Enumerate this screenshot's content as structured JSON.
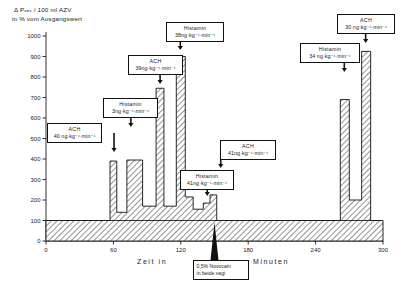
{
  "chart_data": {
    "type": "bar",
    "title": "",
    "ylabel_line1": "Δ Pₒₑₛ / 100 ml AZV",
    "ylabel_line2": "in % vom Ausgangswert",
    "xlabel": "Zeit in",
    "xlabel_tail": "Minuten",
    "xlim": [
      0,
      300
    ],
    "ylim": [
      0,
      1000
    ],
    "ytick_labels": [
      "0",
      "100",
      "200",
      "300",
      "400",
      "500",
      "600",
      "700",
      "800",
      "900",
      "1000"
    ],
    "xtick_labels": [
      "0",
      "60",
      "120",
      "180",
      "240",
      "300"
    ],
    "baseline": 100,
    "grid": false,
    "legend": "none",
    "bar_fill": "hatched-diagonal",
    "segments": [
      {
        "x0": 0,
        "x1": 57,
        "y": 100
      },
      {
        "x0": 57,
        "x1": 63,
        "y": 390
      },
      {
        "x0": 63,
        "x1": 72,
        "y": 140
      },
      {
        "x0": 72,
        "x1": 86,
        "y": 395
      },
      {
        "x0": 86,
        "x1": 98,
        "y": 170
      },
      {
        "x0": 98,
        "x1": 105,
        "y": 745
      },
      {
        "x0": 105,
        "x1": 116,
        "y": 170
      },
      {
        "x0": 116,
        "x1": 124,
        "y": 900
      },
      {
        "x0": 124,
        "x1": 131,
        "y": 215
      },
      {
        "x0": 131,
        "x1": 140,
        "y": 155
      },
      {
        "x0": 140,
        "x1": 146,
        "y": 185
      },
      {
        "x0": 146,
        "x1": 152,
        "y": 225
      },
      {
        "x0": 152,
        "x1": 262,
        "y": 100
      },
      {
        "x0": 262,
        "x1": 270,
        "y": 690
      },
      {
        "x0": 270,
        "x1": 281,
        "y": 200
      },
      {
        "x0": 281,
        "x1": 289,
        "y": 925
      },
      {
        "x0": 289,
        "x1": 300,
        "y": 100
      }
    ],
    "annotations": [
      {
        "id": "ach-40",
        "agent": "ACH",
        "dose": "40 ng·kg⁻¹·min⁻¹",
        "x": 57
      },
      {
        "id": "histamin-3",
        "agent": "Histamin",
        "dose": "3ng·kg⁻¹·min⁻¹",
        "x": 72
      },
      {
        "id": "ach-39",
        "agent": "ACH",
        "dose": "39ng·kg⁻¹·min⁻¹",
        "x": 98
      },
      {
        "id": "histamin-38",
        "agent": "Histamin",
        "dose": "38ng·kg⁻¹·min⁻¹",
        "x": 116
      },
      {
        "id": "histamin-41",
        "agent": "Histamin",
        "dose": "41ng·kg⁻¹·min⁻¹",
        "x": 140
      },
      {
        "id": "ach-41",
        "agent": "ACH",
        "dose": "41ng·kg⁻¹·min⁻¹",
        "x": 152
      },
      {
        "id": "histamin-34",
        "agent": "Histamin",
        "dose": "34 ng·kg⁻¹·min⁻¹",
        "x": 262
      },
      {
        "id": "ach-30",
        "agent": "ACH",
        "dose": "30 ng·kg⁻¹·min⁻¹",
        "x": 281
      }
    ],
    "event_marker": {
      "line1": "0,5% Novocain",
      "line2": "in beide vagi",
      "x": 150,
      "direction": "up"
    }
  }
}
